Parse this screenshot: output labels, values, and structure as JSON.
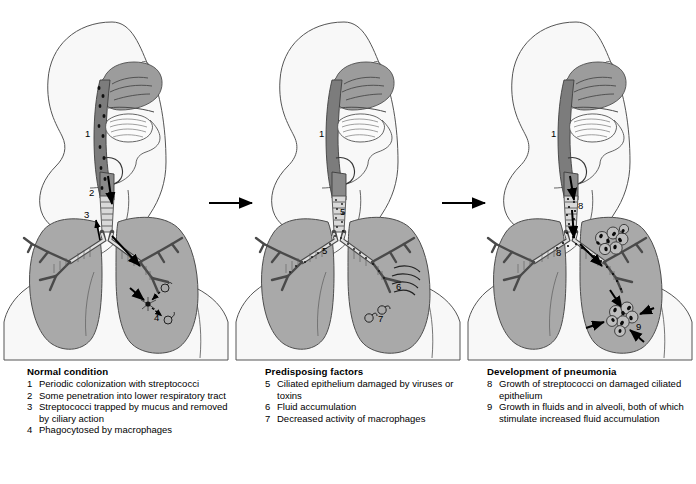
{
  "diagram": {
    "type": "medical-illustration",
    "background_color": "#ffffff",
    "colors": {
      "lung_fill": "#a9a9a9",
      "pharynx_fill": "#7d7d7d",
      "nasal_fill": "#9a9a9a",
      "body_fill": "#f7f7f7",
      "outline": "#4a4a4a",
      "ink": "#000000"
    }
  },
  "panels": [
    {
      "id": "panel-1",
      "name": "normal-condition",
      "labels": [
        {
          "id": "p1-1",
          "text": "1",
          "x": 88,
          "y": 134
        },
        {
          "id": "p1-2a",
          "text": "2",
          "x": 92,
          "y": 193
        },
        {
          "id": "p1-3",
          "text": "3",
          "x": 87,
          "y": 215
        },
        {
          "id": "p1-2b",
          "text": "2",
          "x": 132,
          "y": 259
        },
        {
          "id": "p1-4",
          "text": "4",
          "x": 157,
          "y": 318
        }
      ]
    },
    {
      "id": "panel-2",
      "name": "predisposing-factors",
      "labels": [
        {
          "id": "p2-1",
          "text": "1",
          "x": 322,
          "y": 134
        },
        {
          "id": "p2-5a",
          "text": "5",
          "x": 342,
          "y": 212
        },
        {
          "id": "p2-5b",
          "text": "5",
          "x": 324,
          "y": 251
        },
        {
          "id": "p2-6",
          "text": "6",
          "x": 398,
          "y": 287
        },
        {
          "id": "p2-7",
          "text": "7",
          "x": 380,
          "y": 318
        }
      ]
    },
    {
      "id": "panel-3",
      "name": "development-of-pneumonia",
      "labels": [
        {
          "id": "p3-1",
          "text": "1",
          "x": 554,
          "y": 134
        },
        {
          "id": "p3-8a",
          "text": "8",
          "x": 580,
          "y": 206
        },
        {
          "id": "p3-8b",
          "text": "8",
          "x": 558,
          "y": 253
        },
        {
          "id": "p3-9",
          "text": "9",
          "x": 636,
          "y": 327
        }
      ]
    }
  ],
  "flow_arrows": [
    {
      "id": "arrow-1to2",
      "from": "panel-1",
      "to": "panel-2",
      "x1": 209,
      "y1": 203,
      "x2": 257,
      "y2": 203
    },
    {
      "id": "arrow-2to3",
      "from": "panel-2",
      "to": "panel-3",
      "x1": 442,
      "y1": 203,
      "x2": 490,
      "y2": 203
    }
  ],
  "captions": [
    {
      "id": "caption-1",
      "heading": "Normal condition",
      "items": [
        {
          "num": "1",
          "text": "Periodic colonization with streptococci"
        },
        {
          "num": "2",
          "text": "Some penetration into lower respiratory tract"
        },
        {
          "num": "3",
          "text": "Streptococci trapped by mucus and removed by ciliary action"
        },
        {
          "num": "4",
          "text": "Phagocytosed by macrophages"
        }
      ]
    },
    {
      "id": "caption-2",
      "heading": "Predisposing factors",
      "items": [
        {
          "num": "5",
          "text": "Ciliated epithelium damaged by viruses or toxins"
        },
        {
          "num": "6",
          "text": "Fluid accumulation"
        },
        {
          "num": "7",
          "text": "Decreased activity of macrophages"
        }
      ]
    },
    {
      "id": "caption-3",
      "heading": "Development of pneumonia",
      "items": [
        {
          "num": "8",
          "text": "Growth of streptococci on damaged ciliated epithelium"
        },
        {
          "num": "9",
          "text": "Growth in fluids and in alveoli, both of which stimulate increased fluid accumulation"
        }
      ]
    }
  ]
}
